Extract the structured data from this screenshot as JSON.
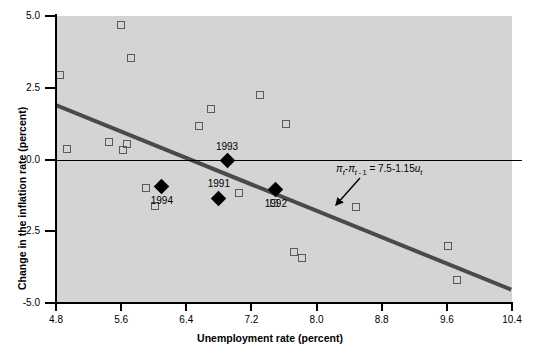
{
  "chart_data": {
    "type": "scatter",
    "title": "",
    "xlabel": "Unemployment rate (percent)",
    "ylabel": "Change in the inflation rate (percent)",
    "xlim": [
      4.8,
      10.4
    ],
    "ylim": [
      -5.0,
      5.0
    ],
    "xticks": [
      "4.8",
      "5.6",
      "6.4",
      "7.2",
      "8.0",
      "8.8",
      "9.6",
      "10.4"
    ],
    "xtick_values": [
      4.8,
      5.6,
      6.4,
      7.2,
      8.0,
      8.8,
      9.6,
      10.4
    ],
    "yticks": [
      "5.0",
      "2.5",
      "0.0",
      "-2.5",
      "-5.0"
    ],
    "ytick_values": [
      5.0,
      2.5,
      0.0,
      -2.5,
      -5.0
    ],
    "grid": false,
    "legend": "none",
    "plot_background": "#d4d4d4",
    "series": [
      {
        "name": "Unlabeled observations",
        "marker": "open-square",
        "marker_color": "#5a5a5a",
        "points": [
          {
            "x": 4.85,
            "y": 2.95
          },
          {
            "x": 4.93,
            "y": 0.35
          },
          {
            "x": 5.45,
            "y": 0.62
          },
          {
            "x": 5.6,
            "y": 4.7
          },
          {
            "x": 5.62,
            "y": 0.33
          },
          {
            "x": 5.67,
            "y": 0.55
          },
          {
            "x": 5.72,
            "y": 3.55
          },
          {
            "x": 5.9,
            "y": -1.0
          },
          {
            "x": 6.02,
            "y": -1.62
          },
          {
            "x": 6.56,
            "y": 1.15
          },
          {
            "x": 6.7,
            "y": 1.75
          },
          {
            "x": 7.05,
            "y": -1.15
          },
          {
            "x": 7.3,
            "y": 2.25
          },
          {
            "x": 7.48,
            "y": -1.5
          },
          {
            "x": 7.62,
            "y": 1.22
          },
          {
            "x": 7.72,
            "y": -3.22
          },
          {
            "x": 7.82,
            "y": -3.42
          },
          {
            "x": 8.48,
            "y": -1.65
          },
          {
            "x": 9.62,
            "y": -3.02
          },
          {
            "x": 9.72,
            "y": -4.2
          }
        ]
      },
      {
        "name": "Labeled years",
        "marker": "filled-diamond",
        "marker_color": "#000000",
        "points": [
          {
            "x": 6.1,
            "y": -0.95,
            "label": "1994",
            "label_pos": "below"
          },
          {
            "x": 6.8,
            "y": -1.35,
            "label": "1991",
            "label_pos": "above"
          },
          {
            "x": 7.5,
            "y": -1.05,
            "label": "1992",
            "label_pos": "below"
          },
          {
            "x": 6.9,
            "y": -0.05,
            "label": "1993",
            "label_pos": "above"
          }
        ]
      }
    ],
    "fit_line": {
      "label": "regression line",
      "color": "#4a4a4a",
      "intercept": 7.5,
      "slope": -1.15,
      "x_start": 4.8,
      "x_end": 10.4,
      "y_start": 1.98,
      "y_end": -4.46
    },
    "annotations": [
      {
        "name": "regression-equation",
        "text": "πt - πt-1 = 7.5 - 1.15ut",
        "html": "<i>π</i><sub><i>t</i></sub>-<i>π</i><sub><i>t</i> - 1</sub> = 7.5-1.15<i>u</i><sub><i>t</i></sub>",
        "arrow": "points down-left toward the fit line"
      }
    ]
  },
  "axis": {
    "x_title": "Unemployment rate (percent)",
    "y_title": "Change in the inflation rate (percent)"
  }
}
